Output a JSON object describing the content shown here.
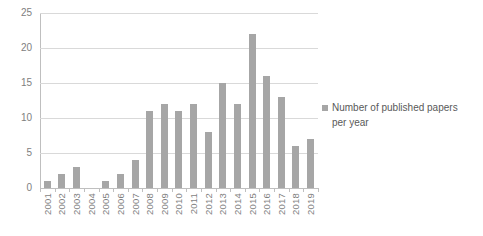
{
  "chart_data": {
    "type": "bar",
    "title": "",
    "xlabel": "",
    "ylabel": "",
    "ylim": [
      0,
      25
    ],
    "yticks": [
      25,
      20,
      15,
      10,
      5,
      0
    ],
    "grid": true,
    "legend_position": "right",
    "series_name": "Number of published papers per year",
    "categories": [
      "2001",
      "2002",
      "2003",
      "2004",
      "2005",
      "2006",
      "2007",
      "2008",
      "2009",
      "2010",
      "2011",
      "2012",
      "2013",
      "2014",
      "2015",
      "2016",
      "2017",
      "2018",
      "2019"
    ],
    "values": [
      1,
      2,
      3,
      0,
      1,
      2,
      4,
      11,
      12,
      11,
      12,
      8,
      15,
      12,
      22,
      16,
      13,
      6,
      7
    ]
  },
  "colors": {
    "bar": "#a6a6a6",
    "gridline": "#d9d9d9",
    "axis": "#bfbfbf",
    "tick_label": "#808080",
    "legend_text": "#595959",
    "background": "#ffffff"
  }
}
